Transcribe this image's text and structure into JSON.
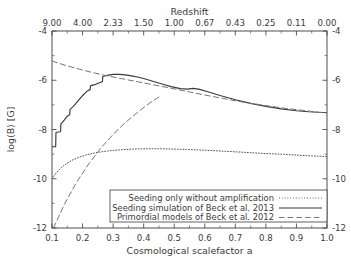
{
  "chart_data": {
    "type": "line",
    "title": "",
    "xlabel": "Cosmological scalefactor a",
    "ylabel": "log(B) [G]",
    "top_axis_label": "Redshift",
    "xlim": [
      0.1,
      1.0
    ],
    "ylim": [
      -12,
      -4
    ],
    "grid": false,
    "legend_position": "bottom-right",
    "x_ticks": [
      "0.1",
      "0.2",
      "0.3",
      "0.4",
      "0.5",
      "0.6",
      "0.7",
      "0.8",
      "0.9",
      "1.0"
    ],
    "x_tick_values": [
      0.1,
      0.2,
      0.3,
      0.4,
      0.5,
      0.6,
      0.7,
      0.8,
      0.9,
      1.0
    ],
    "y_ticks": [
      "-4",
      "-6",
      "-8",
      "-10",
      "-12"
    ],
    "y_tick_values": [
      -4,
      -6,
      -8,
      -10,
      -12
    ],
    "top_ticks": [
      "9.00",
      "4.00",
      "2.33",
      "1.50",
      "1.00",
      "0.67",
      "0.43",
      "0.25",
      "0.11",
      "0.00"
    ],
    "top_tick_values": [
      9.0,
      4.0,
      2.33,
      1.5,
      1.0,
      0.67,
      0.43,
      0.25,
      0.11,
      0.0
    ],
    "series": [
      {
        "name": "Seeding only without amplification",
        "style": "dotted",
        "color": "#555555",
        "x": [
          0.1,
          0.115,
          0.13,
          0.15,
          0.17,
          0.19,
          0.215,
          0.24,
          0.27,
          0.3,
          0.34,
          0.38,
          0.43,
          0.48,
          0.54,
          0.6,
          0.66,
          0.72,
          0.79,
          0.86,
          0.93,
          1.0
        ],
        "y": [
          -10.0,
          -9.74,
          -9.55,
          -9.36,
          -9.22,
          -9.12,
          -9.02,
          -8.95,
          -8.89,
          -8.85,
          -8.81,
          -8.79,
          -8.78,
          -8.79,
          -8.81,
          -8.84,
          -8.88,
          -8.92,
          -8.97,
          -9.01,
          -9.06,
          -9.1
        ]
      },
      {
        "name": "Seeding simulation of Beck et al. 2013",
        "style": "solid",
        "color": "#3a3a3a",
        "x": [
          0.1,
          0.112,
          0.113,
          0.12,
          0.128,
          0.129,
          0.14,
          0.15,
          0.158,
          0.159,
          0.17,
          0.185,
          0.2,
          0.215,
          0.225,
          0.226,
          0.24,
          0.255,
          0.265,
          0.266,
          0.28,
          0.3,
          0.32,
          0.34,
          0.36,
          0.38,
          0.4,
          0.43,
          0.46,
          0.49,
          0.52,
          0.545,
          0.56,
          0.58,
          0.61,
          0.65,
          0.7,
          0.75,
          0.8,
          0.85,
          0.9,
          0.94,
          0.97,
          1.0
        ],
        "y": [
          -8.7,
          -8.7,
          -8.12,
          -8.1,
          -8.09,
          -7.78,
          -7.62,
          -7.46,
          -7.4,
          -7.18,
          -7.06,
          -6.84,
          -6.62,
          -6.44,
          -6.38,
          -6.22,
          -6.18,
          -6.1,
          -6.06,
          -5.86,
          -5.8,
          -5.76,
          -5.76,
          -5.78,
          -5.82,
          -5.87,
          -5.93,
          -6.04,
          -6.15,
          -6.26,
          -6.34,
          -6.36,
          -6.33,
          -6.36,
          -6.47,
          -6.62,
          -6.79,
          -6.94,
          -7.06,
          -7.16,
          -7.24,
          -7.28,
          -7.3,
          -7.31
        ]
      },
      {
        "name": "Primordial models of Beck et al. 2012",
        "style": "dashed",
        "color": "#777777",
        "branches": [
          {
            "x": [
              0.1,
              0.14,
              0.18,
              0.23,
              0.28,
              0.33,
              0.38,
              0.43,
              0.48,
              0.54,
              0.6,
              0.66,
              0.73,
              0.8,
              0.87,
              0.94,
              1.0
            ],
            "y": [
              -5.22,
              -5.38,
              -5.52,
              -5.68,
              -5.82,
              -5.94,
              -6.06,
              -6.18,
              -6.3,
              -6.45,
              -6.6,
              -6.74,
              -6.9,
              -7.03,
              -7.15,
              -7.25,
              -7.33
            ]
          },
          {
            "x": [
              0.105,
              0.14,
              0.18,
              0.22,
              0.26,
              0.3,
              0.34,
              0.38,
              0.42,
              0.45
            ],
            "y": [
              -12.0,
              -11.05,
              -10.15,
              -9.4,
              -8.75,
              -8.2,
              -7.72,
              -7.3,
              -6.92,
              -6.68
            ]
          }
        ]
      }
    ]
  },
  "legend": {
    "entries": [
      {
        "label": "Seeding only without amplification",
        "style": "dotted"
      },
      {
        "label": "Seeding simulation of Beck et al. 2013",
        "style": "solid"
      },
      {
        "label": "Primordial models of Beck et al. 2012",
        "style": "dashed"
      }
    ]
  }
}
